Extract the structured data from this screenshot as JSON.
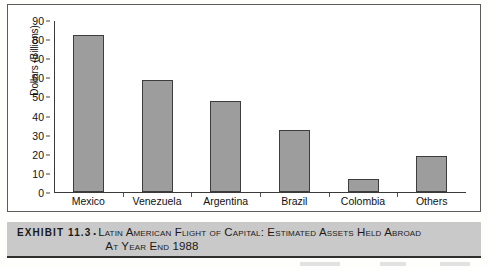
{
  "chart_data": {
    "type": "bar",
    "title": "",
    "xlabel": "",
    "ylabel": "Dollars (Billions)",
    "categories": [
      "Mexico",
      "Venezuela",
      "Argentina",
      "Brazil",
      "Colombia",
      "Others"
    ],
    "values": [
      82,
      58.5,
      47.5,
      32.5,
      7,
      19
    ],
    "ylim": [
      0,
      90
    ],
    "yticks": [
      0,
      10,
      20,
      30,
      40,
      50,
      60,
      70,
      80,
      90
    ],
    "ytick_labels": [
      "0",
      "10",
      "20",
      "30",
      "40",
      "50",
      "60",
      "70",
      "80",
      "90"
    ],
    "grid": false,
    "legend": false,
    "bar_color": "#9d9d9d",
    "bar_edge_color": "#3d3d3d",
    "axis_color": "#3a3a3a"
  },
  "caption": {
    "exhibit_label": "EXHIBIT 11.3",
    "bullet": "•",
    "title_line1": "Latin American Flight of Capital: Estimated Assets Held Abroad",
    "title_line2": "At Year End 1988",
    "band_color": "#c9c9c9"
  }
}
